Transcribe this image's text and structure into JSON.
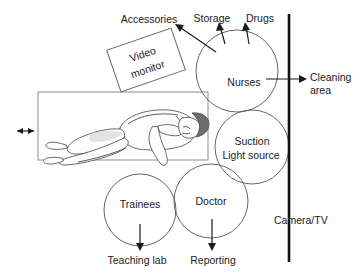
{
  "diagram": {
    "colors": {
      "ink": "#1a1a1a",
      "circle_stroke": "#555555",
      "wall": "#111111",
      "bed": "#8d8d8d",
      "hair": "#6e6e6e"
    },
    "external_labels": {
      "accessories": "Accessories",
      "storage": "Storage",
      "drugs": "Drugs",
      "cleaning_area_line1": "Cleaning",
      "cleaning_area_line2": "area",
      "teaching_lab": "Teaching lab",
      "reporting": "Reporting",
      "camera_tv": "Camera/TV"
    },
    "zones": [
      {
        "name": "video-monitor",
        "shape": "rotated-rectangle",
        "label_line1": "Video",
        "label_line2": "monitor"
      },
      {
        "name": "nurses",
        "shape": "circle",
        "label": "Nurses"
      },
      {
        "name": "suction-light-source",
        "shape": "circle",
        "label_line1": "Suction",
        "label_line2": "Light source"
      },
      {
        "name": "trainees",
        "shape": "circle",
        "label": "Trainees"
      },
      {
        "name": "doctor",
        "shape": "circle",
        "label": "Doctor"
      }
    ],
    "patient": {
      "name": "patient-on-table",
      "description": "Patient lying in left lateral position on examination table"
    }
  }
}
